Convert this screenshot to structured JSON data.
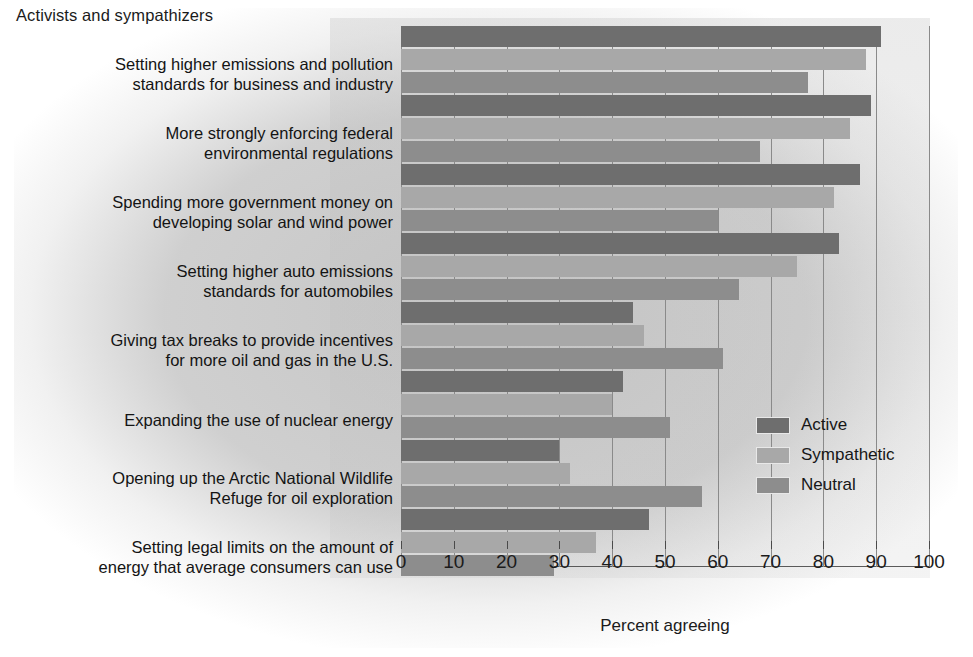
{
  "caption": "Activists and sympathizers",
  "legend": {
    "position": "inside-right",
    "entries": [
      {
        "label": "Active",
        "color": "#6e6e6e",
        "swatch_name": "legend-swatch-active"
      },
      {
        "label": "Sympathetic",
        "color": "#a8a8a8",
        "swatch_name": "legend-swatch-sympathetic"
      },
      {
        "label": "Neutral",
        "color": "#8d8d8d",
        "swatch_name": "legend-swatch-neutral"
      }
    ]
  },
  "axis": {
    "x_title": "Percent agreeing",
    "ticks": [
      "0",
      "10",
      "20",
      "30",
      "40",
      "50",
      "60",
      "70",
      "80",
      "90",
      "100"
    ]
  },
  "categories_text": [
    {
      "line1": "Setting higher emissions and pollution",
      "line2": "standards for business and industry"
    },
    {
      "line1": "More strongly enforcing federal",
      "line2": "environmental regulations"
    },
    {
      "line1": "Spending more government money on",
      "line2": "developing solar and wind power"
    },
    {
      "line1": "Setting higher auto emissions",
      "line2": "standards for automobiles"
    },
    {
      "line1": "Giving tax breaks to provide incentives",
      "line2": "for more oil and gas in the U.S."
    },
    {
      "line1": "Expanding the use of nuclear energy",
      "line2": ""
    },
    {
      "line1": "Opening up the Arctic National Wildlife",
      "line2": "Refuge for oil exploration"
    },
    {
      "line1": "Setting legal limits on the amount of",
      "line2": "energy that average consumers can use"
    }
  ],
  "chart_data": {
    "type": "bar",
    "orientation": "horizontal",
    "title": "Activists and sympathizers",
    "xlabel": "Percent agreeing",
    "ylabel": "",
    "xlim": [
      0,
      100
    ],
    "xticks": [
      0,
      10,
      20,
      30,
      40,
      50,
      60,
      70,
      80,
      90,
      100
    ],
    "grid": true,
    "legend_position": "inside-right",
    "categories": [
      "Setting higher emissions and pollution standards for business and industry",
      "More strongly enforcing federal environmental regulations",
      "Spending more government money on developing solar and wind power",
      "Setting higher auto emissions standards for automobiles",
      "Giving tax breaks to provide incentives for more oil and gas in the U.S.",
      "Expanding the use of nuclear energy",
      "Opening up the Arctic National Wildlife Refuge for oil exploration",
      "Setting legal limits on the amount of energy that average consumers can use"
    ],
    "series": [
      {
        "name": "Active",
        "color": "#6e6e6e",
        "values": [
          91,
          89,
          87,
          83,
          44,
          42,
          30,
          47
        ]
      },
      {
        "name": "Sympathetic",
        "color": "#a8a8a8",
        "values": [
          88,
          85,
          82,
          75,
          46,
          40,
          32,
          37
        ]
      },
      {
        "name": "Neutral",
        "color": "#8d8d8d",
        "values": [
          77,
          68,
          60,
          64,
          61,
          51,
          57,
          29
        ]
      }
    ]
  },
  "layout": {
    "plot_left": 401,
    "plot_top": 26,
    "plot_width": 528,
    "plot_height": 541,
    "group_tops": [
      26,
      95,
      164,
      233,
      302,
      371,
      440,
      509
    ],
    "bar_height": 21,
    "bar_gap": 2,
    "label_tops": [
      54,
      123,
      192,
      261,
      330,
      410,
      468,
      537
    ]
  }
}
